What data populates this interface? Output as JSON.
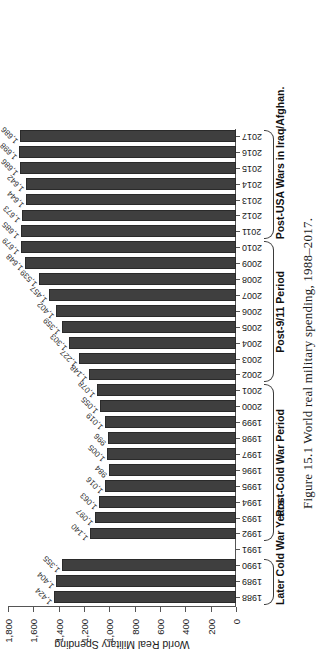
{
  "figure": {
    "caption": "Figure 15.1  World real military spending, 1988–2017."
  },
  "chart_data": {
    "type": "bar",
    "title": "",
    "xlabel": "",
    "ylabel": "World Real Military Spending",
    "ylim": [
      0,
      1800
    ],
    "yticks": [
      0,
      200,
      400,
      600,
      800,
      1000,
      1200,
      1400,
      1600,
      1800
    ],
    "ytick_labels": [
      "0",
      "200",
      "400",
      "600",
      "800",
      "1,000",
      "1,200",
      "1,400",
      "1,600",
      "1,800"
    ],
    "grid": false,
    "legend": null,
    "bar_color": "#3f3f3f",
    "categories": [
      "1988",
      "1989",
      "1990",
      "1991",
      "1992",
      "1993",
      "1994",
      "1995",
      "1996",
      "1997",
      "1998",
      "1999",
      "2000",
      "2001",
      "2002",
      "2003",
      "2004",
      "2005",
      "2006",
      "2007",
      "2008",
      "2009",
      "2010",
      "2011",
      "2012",
      "2013",
      "2014",
      "2015",
      "2016",
      "2017"
    ],
    "values": [
      1424,
      1404,
      1355,
      null,
      1140,
      1097,
      1063,
      1016,
      984,
      1005,
      996,
      1019,
      1055,
      1078,
      1148,
      1227,
      1303,
      1359,
      1402,
      1457,
      1539,
      1648,
      1679,
      1685,
      1673,
      1644,
      1642,
      1686,
      1698,
      1686
    ],
    "value_labels": [
      "1,424",
      "1,404",
      "1,355",
      "",
      "1,140",
      "1,097",
      "1,063",
      "1,016",
      "984",
      "1,005",
      "996",
      "1,019",
      "1,055",
      "1,078",
      "1,148",
      "1,227",
      "1,303",
      "1,359",
      "1,402",
      "1,457",
      "1,539",
      "1,648",
      "1,679",
      "1,685",
      "1,673",
      "1,644",
      "1,642",
      "1,686",
      "1,698",
      "1,686"
    ],
    "groups": [
      {
        "label": "Later Cold War Years",
        "start": "1988",
        "end": "1990"
      },
      {
        "label": "Post-Cold War Period",
        "start": "1992",
        "end": "2001"
      },
      {
        "label": "Post-9/11 Period",
        "start": "2002",
        "end": "2010"
      },
      {
        "label": "Post-USA Wars in Iraq/Afghan.",
        "start": "2011",
        "end": "2017"
      }
    ]
  }
}
